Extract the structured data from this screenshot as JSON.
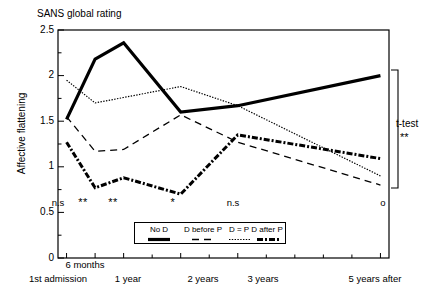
{
  "chart_data": {
    "type": "line",
    "title": "SANS global rating",
    "xlabel": "",
    "ylabel": "Affective flattening",
    "ylim": [
      0,
      2.5
    ],
    "yticks": [
      "0",
      "0.5",
      "1",
      "1.5",
      "2",
      "2.5"
    ],
    "ytick_values": [
      0,
      0.5,
      1,
      1.5,
      2,
      2.5
    ],
    "grid": false,
    "legend_position": "bottom-center",
    "categories": [
      "1st admission",
      "6 months",
      "1 year",
      "2 years",
      "3 years",
      "5 years after"
    ],
    "x_positions": [
      0,
      1,
      2,
      4,
      6,
      11
    ],
    "xlim": [
      -0.3,
      11.3
    ],
    "series": [
      {
        "name": "No D",
        "style": "solid-thick",
        "values": [
          1.52,
          2.18,
          2.36,
          1.6,
          1.67,
          2.0
        ]
      },
      {
        "name": "D before P",
        "style": "dashed",
        "values": [
          1.55,
          1.17,
          1.19,
          1.57,
          1.27,
          0.8
        ]
      },
      {
        "name": "D = P",
        "style": "dotted",
        "values": [
          1.95,
          1.7,
          1.76,
          1.88,
          1.67,
          0.9
        ]
      },
      {
        "name": "D after P",
        "style": "dash-dot-thick",
        "values": [
          1.27,
          0.77,
          0.88,
          0.7,
          1.35,
          1.09
        ]
      }
    ],
    "significance_markers": [
      {
        "label": "n.s",
        "category": "1st admission"
      },
      {
        "label": "**",
        "category": "6 months"
      },
      {
        "label": "**",
        "category": "1 year"
      },
      {
        "label": "*",
        "category": "2 years"
      },
      {
        "label": "n.s",
        "category": "3 years"
      },
      {
        "label": "o",
        "category": "5 years after"
      }
    ],
    "significance_y": 0.55,
    "annotations": [
      {
        "name": "t-test",
        "label": "t-test",
        "stars": "**"
      }
    ]
  },
  "colors": {
    "axis": "#000000",
    "series": "#000000",
    "background": "#ffffff"
  }
}
